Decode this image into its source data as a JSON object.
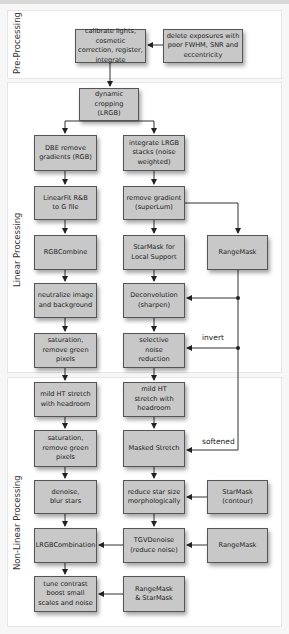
{
  "sections": {
    "pre": "Pre-Processing",
    "linear": "Linear Processing",
    "nonlinear": "Non-Linear Processing"
  },
  "boxes": {
    "calibrate": "calibrate lights, cosmetic correction, register, integrate",
    "delete": "delete exposures with poor FWHM, SNR and eccentricity",
    "dynamic": "dynamic cropping (LRGB)",
    "dbe": "DBE remove gradients (RGB)",
    "integrate": "integrate LRGB stacks (noise weighted)",
    "linearfit": "LinearFit R&B to G file",
    "remove_gradient": "remove gradient (superLum)",
    "rgbcombine": "RGBCombine",
    "starmask_local": "StarMask for Local Support",
    "rangemask_1": "RangeMask",
    "neutralize": "neutralize image and background",
    "deconvolution": "Deconvolution (sharpen)",
    "saturation_1": "saturation, remove green pixels",
    "selective": "selective noise reduction",
    "mild_ht_left": "mild HT stretch with headroom",
    "mild_ht_right": "mild HT stretch with headroom",
    "saturation_2": "saturation, remove green pixels",
    "masked_stretch": "Masked Stretch",
    "denoise": "denoise, blur stars",
    "reduce_star": "reduce star size morphologically",
    "starmask_contour": "StarMask (contour)",
    "lrgbcombination": "LRGBCombination",
    "tgvdenoise": "TGVDenoise (reduce noise)",
    "rangemask_2": "RangeMask",
    "tune": "tune contrast boost small scales and noise",
    "rangemask_starmask": "RangeMask & StarMask"
  },
  "annotations": {
    "invert": "invert",
    "softened": "softened"
  },
  "colors": {
    "box_fill": "#c8c8c8",
    "box_border": "#555555",
    "panel_bg": "#ffffff",
    "page_bg": "#f7f7f7",
    "line": "#333333"
  }
}
